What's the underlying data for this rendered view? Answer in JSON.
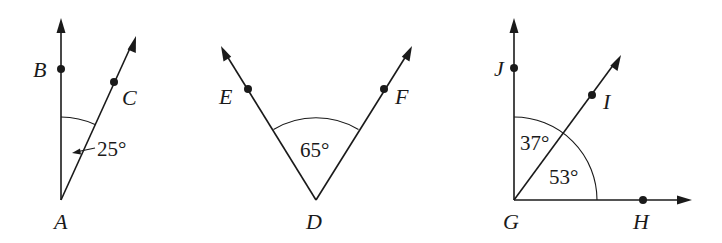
{
  "figures": [
    {
      "id": "angle-BAC",
      "vertex": "A",
      "points": [
        "B",
        "C"
      ],
      "angle_label": "25°",
      "labels": {
        "A": "A",
        "B": "B",
        "C": "C"
      }
    },
    {
      "id": "angle-EDF",
      "vertex": "D",
      "points": [
        "E",
        "F"
      ],
      "angle_label": "65°",
      "labels": {
        "D": "D",
        "E": "E",
        "F": "F"
      }
    },
    {
      "id": "angle-JGH",
      "vertex": "G",
      "points": [
        "J",
        "I",
        "H"
      ],
      "angle_labels": {
        "JGI": "37°",
        "IGH": "53°"
      },
      "labels": {
        "G": "G",
        "H": "H",
        "I": "I",
        "J": "J"
      }
    }
  ],
  "colors": {
    "ink": "#1a1a1a",
    "background": "#ffffff"
  }
}
